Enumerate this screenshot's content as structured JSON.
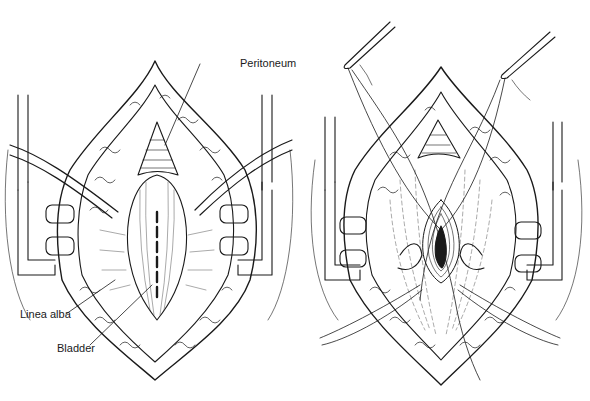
{
  "figure": {
    "colors": {
      "ink": "#1a1a1a",
      "paper": "#ffffff",
      "hatch": "#555555"
    },
    "panels": [
      {
        "id": "left",
        "description": "Midline incision with retractors; peritoneum exposed above bladder, incision marked on linea alba",
        "labels": [
          {
            "text": "Peritoneum",
            "x": 195,
            "y": 58
          },
          {
            "text": "Linea alba",
            "x": 20,
            "y": 314
          },
          {
            "text": "Bladder",
            "x": 57,
            "y": 144
          }
        ]
      },
      {
        "id": "right",
        "description": "Stay sutures held by forceps; bladder opened with purse-string around the incision",
        "labels": []
      }
    ],
    "labels": {
      "peritoneum": "Peritoneum",
      "linea_alba": "Linea alba",
      "bladder": "Bladder"
    }
  }
}
